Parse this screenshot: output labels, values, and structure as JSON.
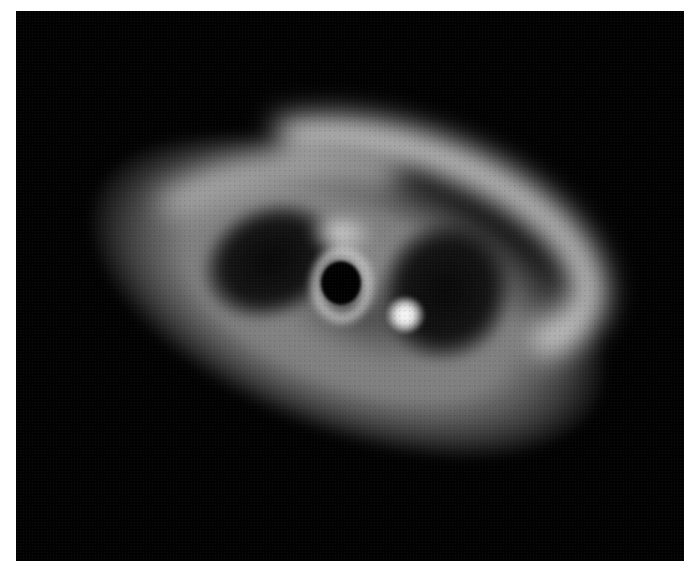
{
  "image": {
    "subject": "protoplanetary disk",
    "colors": {
      "background": "#020202",
      "frame": "#ffffff",
      "disk_glow": "#969696",
      "bright_arc": "#e1e1e1",
      "clump": "#ffffff"
    },
    "features": [
      {
        "name": "outer-disk",
        "description": "tilted elliptical disk envelope"
      },
      {
        "name": "upper-arc",
        "description": "bright spiral arm along the upper edge"
      },
      {
        "name": "left-gap",
        "description": "dark gap left of center"
      },
      {
        "name": "right-gap",
        "description": "dark gap right of center"
      },
      {
        "name": "inner-ring",
        "description": "bright ring around the central cavity"
      },
      {
        "name": "central-cavity",
        "description": "dark central hole"
      },
      {
        "name": "bright-clump",
        "description": "compact bright blob lower right of center"
      }
    ]
  }
}
